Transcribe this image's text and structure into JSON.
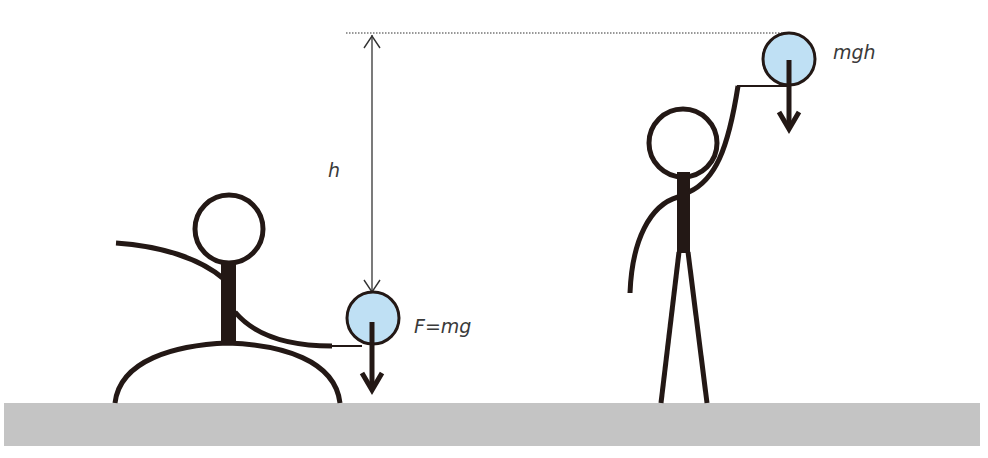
{
  "diagram": {
    "labels": {
      "height": "h",
      "force": "F=mg",
      "potential_energy": "mgh"
    },
    "colors": {
      "background": "#ffffff",
      "ground": "#c4c4c4",
      "figure_stroke": "#231815",
      "ball_fill": "#bfe0f4",
      "text": "#3a3a3a",
      "dimension_line": "#333333"
    },
    "elements": [
      {
        "id": "crouching-figure",
        "desc": "stick figure crouching, holding the ball low"
      },
      {
        "id": "ball-low",
        "desc": "ball at low position with downward force arrow"
      },
      {
        "id": "height-arrow",
        "desc": "double-headed arrow marking height h"
      },
      {
        "id": "reference-line",
        "desc": "dotted horizontal line at the raised ball height"
      },
      {
        "id": "standing-figure",
        "desc": "stick figure standing, holding the ball raised"
      },
      {
        "id": "ball-high",
        "desc": "raised ball with downward force arrow"
      },
      {
        "id": "ground",
        "desc": "grey ground strip"
      }
    ]
  }
}
